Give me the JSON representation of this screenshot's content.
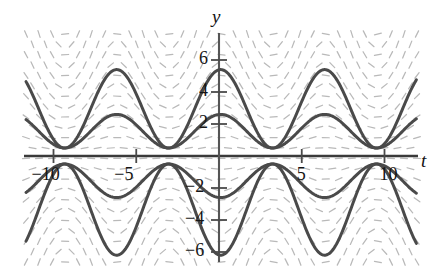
{
  "figure": {
    "title": "",
    "background_color": "#ffffff",
    "curve_color": "#4a4a4a",
    "axis_color": "#3a3a3a",
    "slope_field_color": "#b9b9b9"
  },
  "axes": {
    "x_label": "t",
    "y_label": "y",
    "x_ticks": [
      {
        "value": -10,
        "label": "−10"
      },
      {
        "value": -5,
        "label": "−5"
      },
      {
        "value": 5,
        "label": "5"
      },
      {
        "value": 10,
        "label": "10"
      }
    ],
    "y_ticks": [
      {
        "value": 6,
        "label": "6"
      },
      {
        "value": 4,
        "label": "4"
      },
      {
        "value": 2,
        "label": "2"
      },
      {
        "value": -2,
        "label": "−2"
      },
      {
        "value": -4,
        "label": "−4"
      },
      {
        "value": -6,
        "label": "−6"
      }
    ],
    "xlim": [
      -12.4,
      12.6
    ],
    "ylim": [
      -7.9,
      6.9
    ],
    "grid": false
  },
  "chart_data": {
    "type": "line",
    "title": "",
    "xlabel": "t",
    "ylabel": "y",
    "xlim": [
      -12.4,
      12.6
    ],
    "ylim": [
      -7.9,
      6.9
    ],
    "grid": false,
    "legend": "none",
    "slope_field": {
      "shown": true,
      "style": "short dashes",
      "color": "#b9b9b9",
      "grid_nx": 30,
      "grid_ny": 22
    },
    "series": [
      {
        "name": "upper-outer",
        "color": "#4a4a4a",
        "amplitude": 2.45,
        "offset": 2.95,
        "period": 6.2832,
        "phase": -0.1
      },
      {
        "name": "upper-inner",
        "color": "#4a4a4a",
        "amplitude": 1.05,
        "offset": 1.55,
        "period": 6.2832,
        "phase": -0.1
      },
      {
        "name": "lower-inner",
        "color": "#4a4a4a",
        "amplitude": -1.05,
        "offset": -1.55,
        "period": 6.2832,
        "phase": -0.1
      },
      {
        "name": "lower-outer",
        "color": "#4a4a4a",
        "amplitude": -2.85,
        "offset": -3.35,
        "period": 6.2832,
        "phase": -0.1
      }
    ]
  }
}
